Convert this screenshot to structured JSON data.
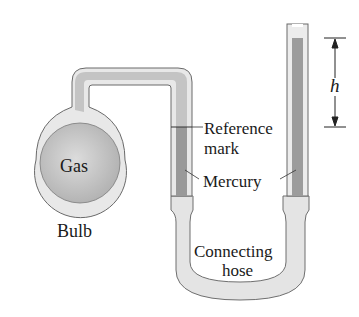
{
  "diagram": {
    "type": "open-tube manometer",
    "labels": {
      "gas": "Gas",
      "bulb": "Bulb",
      "reference": "Reference",
      "reference_line2": "mark",
      "mercury": "Mercury",
      "hose": "Connecting",
      "hose_line2": "hose",
      "height": "h"
    },
    "colors": {
      "glass": "#e6e6e6",
      "glass_edge": "#777777",
      "mercury": "#9a9a9a",
      "gas": "#c2c2c2",
      "hose": "#e2e2e2"
    }
  }
}
